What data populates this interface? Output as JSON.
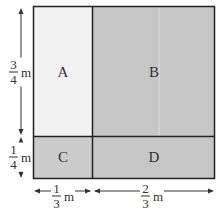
{
  "diagram": {
    "regions": [
      {
        "id": "A",
        "label": "A",
        "color": "#f2f2f2"
      },
      {
        "id": "B",
        "label": "B",
        "color": "#c6c6c6"
      },
      {
        "id": "C",
        "label": "C",
        "color": "#cbcbcb"
      },
      {
        "id": "D",
        "label": "D",
        "color": "#c6c6c6"
      }
    ],
    "dimensions": {
      "left_top": {
        "num": "3",
        "den": "4",
        "unit": "m"
      },
      "left_bottom": {
        "num": "1",
        "den": "4",
        "unit": "m"
      },
      "bottom_left": {
        "num": "1",
        "den": "3",
        "unit": "m"
      },
      "bottom_right": {
        "num": "2",
        "den": "3",
        "unit": "m"
      }
    }
  }
}
